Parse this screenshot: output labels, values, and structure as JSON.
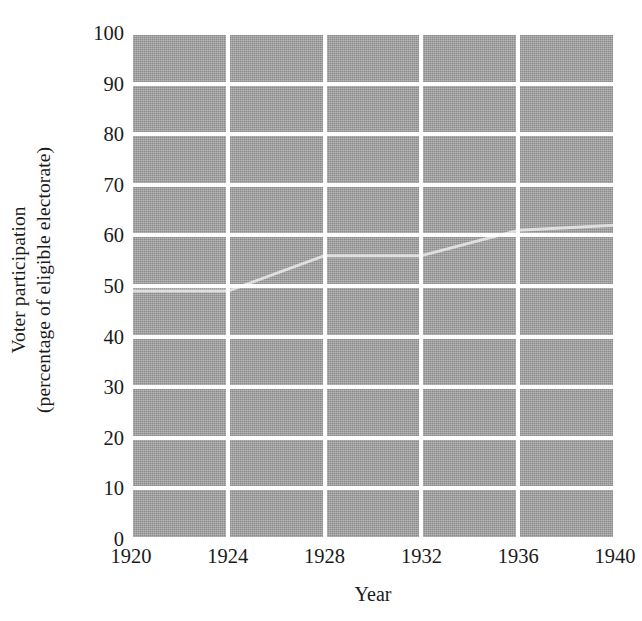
{
  "chart_data": {
    "type": "line",
    "title": "",
    "xlabel": "Year",
    "ylabel_line1": "Voter participation",
    "ylabel_line2": "(percentage of eligible electorate)",
    "x": [
      1920,
      1924,
      1928,
      1932,
      1936,
      1940
    ],
    "xtick_labels": [
      "1920",
      "1924",
      "1928",
      "1932",
      "1936",
      "1940"
    ],
    "values": [
      49,
      49,
      56,
      56,
      61,
      62
    ],
    "series": [
      {
        "name": "Voter participation",
        "values": [
          49,
          49,
          56,
          56,
          61,
          62
        ]
      }
    ],
    "ytick_labels": [
      "0",
      "10",
      "20",
      "30",
      "40",
      "50",
      "60",
      "70",
      "80",
      "90",
      "100"
    ],
    "ytick_values": [
      0,
      10,
      20,
      30,
      40,
      50,
      60,
      70,
      80,
      90,
      100
    ],
    "ylim": [
      0,
      100
    ],
    "xlim": [
      1920,
      1940
    ],
    "grid": true,
    "legend": "none",
    "plot_background_color": "#9b9b9b",
    "gridline_color": "#fdfdfd",
    "series_color": "#eaeaea",
    "axis_text_color": "#1a1a1a"
  }
}
